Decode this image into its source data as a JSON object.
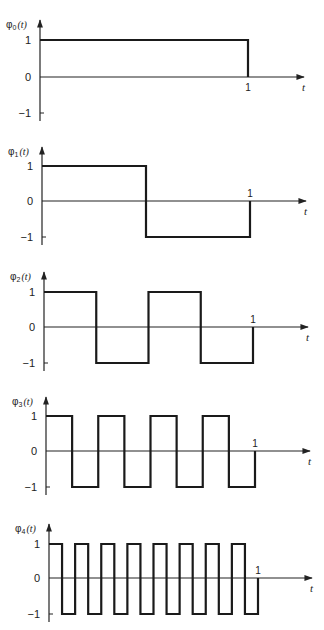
{
  "chart_data": [
    {
      "type": "line",
      "step": true,
      "title": "φ0(t)",
      "function": "phi_0",
      "ylabel": "φ0(t)",
      "xlabel": "t",
      "x_ticks": [
        "1"
      ],
      "y_ticks": [
        "1",
        "0",
        "−1"
      ],
      "xlim": [
        0,
        1
      ],
      "ylim": [
        -1,
        1
      ],
      "segments": 1,
      "x": [
        0,
        1
      ],
      "values": [
        1
      ]
    },
    {
      "type": "line",
      "step": true,
      "title": "φ1(t)",
      "function": "phi_1",
      "ylabel": "φ1(t)",
      "xlabel": "t",
      "x_ticks": [
        "1"
      ],
      "y_ticks": [
        "1",
        "0",
        "−1"
      ],
      "xlim": [
        0,
        1
      ],
      "ylim": [
        -1,
        1
      ],
      "segments": 2,
      "x": [
        0,
        0.5,
        1
      ],
      "values": [
        1,
        -1
      ]
    },
    {
      "type": "line",
      "step": true,
      "title": "φ2(t)",
      "function": "phi_2",
      "ylabel": "φ2(t)",
      "xlabel": "t",
      "x_ticks": [
        "1"
      ],
      "y_ticks": [
        "1",
        "0",
        "−1"
      ],
      "xlim": [
        0,
        1
      ],
      "ylim": [
        -1,
        1
      ],
      "segments": 4,
      "x": [
        0,
        0.25,
        0.5,
        0.75,
        1
      ],
      "values": [
        1,
        -1,
        1,
        -1
      ]
    },
    {
      "type": "line",
      "step": true,
      "title": "φ3(t)",
      "function": "phi_3",
      "ylabel": "φ3(t)",
      "xlabel": "t",
      "x_ticks": [
        "1"
      ],
      "y_ticks": [
        "1",
        "0",
        "−1"
      ],
      "xlim": [
        0,
        1
      ],
      "ylim": [
        -1,
        1
      ],
      "segments": 8,
      "x": [
        0,
        0.125,
        0.25,
        0.375,
        0.5,
        0.625,
        0.75,
        0.875,
        1
      ],
      "values": [
        1,
        -1,
        1,
        -1,
        1,
        -1,
        1,
        -1
      ]
    },
    {
      "type": "line",
      "step": true,
      "title": "φ4(t)",
      "function": "phi_4",
      "ylabel": "φ4(t)",
      "xlabel": "t",
      "x_ticks": [
        "1"
      ],
      "y_ticks": [
        "1",
        "0",
        "−1"
      ],
      "xlim": [
        0,
        1
      ],
      "ylim": [
        -1,
        1
      ],
      "segments": 16,
      "x": [
        0,
        0.0625,
        0.125,
        0.1875,
        0.25,
        0.3125,
        0.375,
        0.4375,
        0.5,
        0.5625,
        0.625,
        0.6875,
        0.75,
        0.8125,
        0.875,
        0.9375,
        1
      ],
      "values": [
        1,
        -1,
        1,
        -1,
        1,
        -1,
        1,
        -1,
        1,
        -1,
        1,
        -1,
        1,
        -1,
        1,
        -1
      ]
    }
  ],
  "panels": [
    {
      "ylabel_sym": "φ",
      "ylabel_sub": "0",
      "ylabel_arg": "(t)",
      "tick_one": "1",
      "tick_zero": "0",
      "tick_neg": "−1",
      "x_tick": "1",
      "x_label": "t"
    },
    {
      "ylabel_sym": "φ",
      "ylabel_sub": "1",
      "ylabel_arg": "(t)",
      "tick_one": "1",
      "tick_zero": "0",
      "tick_neg": "−1",
      "x_tick": "1",
      "x_label": "t"
    },
    {
      "ylabel_sym": "φ",
      "ylabel_sub": "2",
      "ylabel_arg": "(t)",
      "tick_one": "1",
      "tick_zero": "0",
      "tick_neg": "−1",
      "x_tick": "1",
      "x_label": "t"
    },
    {
      "ylabel_sym": "φ",
      "ylabel_sub": "3",
      "ylabel_arg": "(t)",
      "tick_one": "1",
      "tick_zero": "0",
      "tick_neg": "−1",
      "x_tick": "1",
      "x_label": "t"
    },
    {
      "ylabel_sym": "φ",
      "ylabel_sub": "4",
      "ylabel_arg": "(t)",
      "tick_one": "1",
      "tick_zero": "0",
      "tick_neg": "−1",
      "x_tick": "1",
      "x_label": "t"
    }
  ]
}
